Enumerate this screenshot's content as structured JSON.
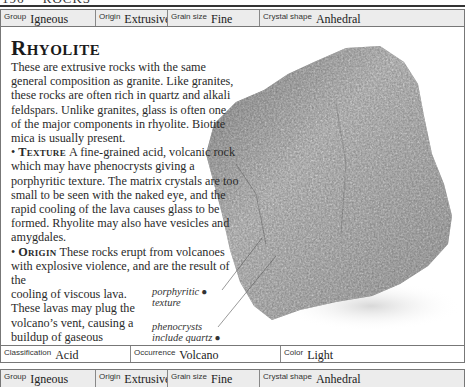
{
  "running_head": {
    "page_number": "196",
    "section": "ROCKS"
  },
  "info_top": {
    "group": {
      "label": "Group",
      "value": "Igneous"
    },
    "origin": {
      "label": "Origin",
      "value": "Extrusive"
    },
    "grain_size": {
      "label": "Grain size",
      "value": "Fine"
    },
    "crystal_shape": {
      "label": "Crystal shape",
      "value": "Anhedral"
    }
  },
  "entry": {
    "title": "Rhyolite",
    "intro": "These are extrusive rocks with the same general composition as granite. Like granites, these rocks are often rich in quartz and alkali feldspars. Unlike granites, glass is often one of the major components in rhyolite. Biotite mica is usually present.",
    "texture": {
      "bullet": "•",
      "heading": "Texture",
      "text": "A fine-grained acid, volcanic rock which may have phenocrysts giving a porphyritic texture. The matrix crystals are too small to be seen with the naked eye, and the rapid cooling of the lava causes glass to be formed. Rhyolite may also have vesicles and amygdales."
    },
    "origin": {
      "bullet": "•",
      "heading": "Origin",
      "text_wide": "These rocks erupt from volcanoes with explosive violence, and are the result of the",
      "text_narrow": "cooling of viscous lava. These lavas may plug the volcano’s vent, causing a buildup of gaseous pressure."
    }
  },
  "annotations": [
    {
      "line1": "porphyritic",
      "line2": "texture"
    },
    {
      "line1": "phenocrysts",
      "line2": "include quartz"
    }
  ],
  "info_bottom": {
    "classification": {
      "label": "Classification",
      "value": "Acid"
    },
    "occurrence": {
      "label": "Occurrence",
      "value": "Volcano"
    },
    "color": {
      "label": "Color",
      "value": "Light"
    }
  },
  "info_next": {
    "group": {
      "label": "Group",
      "value": "Igneous"
    },
    "origin": {
      "label": "Origin",
      "value": "Extrusive"
    },
    "grain_size": {
      "label": "Grain size",
      "value": "Fine"
    },
    "crystal_shape": {
      "label": "Crystal shape",
      "value": "Anhedral"
    }
  },
  "colors": {
    "bar_bg": "#ececec",
    "rule": "#333333",
    "border": "#777777",
    "text": "#2a2a2a"
  }
}
